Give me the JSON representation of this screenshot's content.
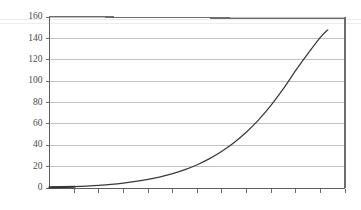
{
  "chart_data": {
    "type": "line",
    "title": "",
    "subtitle": "",
    "xlabel": "",
    "ylabel": "",
    "grid": true,
    "grid_axis": "y",
    "legend": false,
    "legend_position": "none",
    "xlim": [
      0,
      12
    ],
    "ylim": [
      0,
      160
    ],
    "y_ticks": [
      0,
      20,
      40,
      60,
      80,
      100,
      120,
      140,
      160
    ],
    "y_tick_labels": [
      "0",
      "20",
      "40",
      "60",
      "80",
      "100",
      "120",
      "140",
      "160"
    ],
    "x_ticks": [
      0,
      1,
      2,
      3,
      4,
      5,
      6,
      7,
      8,
      9,
      10,
      11,
      12
    ],
    "x_tick_labels": [
      "",
      "",
      "",
      "",
      "",
      "",
      "",
      "",
      "",
      "",
      "",
      "",
      ""
    ],
    "annotations": [],
    "series": [
      {
        "name": "growth-curve",
        "color": "#3a3a3a",
        "x": [
          0.0,
          0.5,
          1.0,
          1.5,
          2.0,
          2.5,
          3.0,
          3.5,
          4.0,
          4.5,
          5.0,
          5.5,
          6.0,
          6.5,
          7.0,
          7.5,
          8.0,
          8.5,
          9.0,
          9.5,
          10.0,
          10.5,
          11.0,
          11.3
        ],
        "values": [
          0.6,
          0.9,
          1.3,
          1.8,
          2.5,
          3.4,
          4.6,
          6.1,
          8.0,
          10.4,
          13.4,
          17.2,
          21.8,
          27.5,
          34.4,
          42.6,
          52.4,
          64.0,
          77.6,
          93.0,
          110.0,
          126.0,
          141.0,
          148.0
        ]
      }
    ]
  },
  "axes": {
    "y_axis_name": "y-axis",
    "x_axis_name": "x-axis"
  },
  "colors": {
    "curve": "#3a3a3a",
    "gridline": "#b9b9b9",
    "frame": "#6d6d6d",
    "tick_label": "#4a4a4a",
    "background": "#ffffff"
  }
}
